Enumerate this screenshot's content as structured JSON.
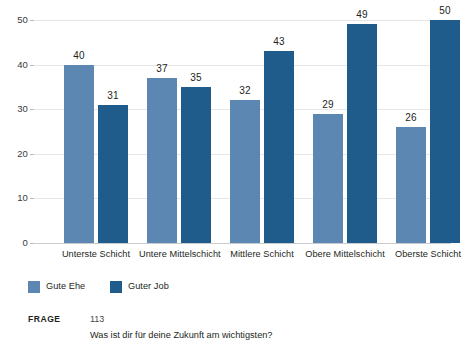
{
  "chart_data": {
    "type": "bar",
    "title": "",
    "subtitle": "",
    "xlabel": "",
    "ylabel": "",
    "ylim": [
      0,
      50
    ],
    "yticks": [
      0,
      10,
      20,
      30,
      40,
      50
    ],
    "ytick_labels": [
      "0",
      "10",
      "20",
      "30",
      "40",
      "50"
    ],
    "grid": true,
    "grid_axis": "y",
    "legend_position": "bottom-left",
    "categories": [
      "Unterste Schicht",
      "Untere Mittelschicht",
      "Mittlere Schicht",
      "Obere Mittelschicht",
      "Oberste Schicht"
    ],
    "series": [
      {
        "name": "Gute Ehe",
        "color": "#5b87b2",
        "values": [
          40,
          37,
          32,
          29,
          26
        ],
        "value_labels": [
          "40",
          "37",
          "32",
          "29",
          "26"
        ]
      },
      {
        "name": "Guter Job",
        "color": "#1f5c8b",
        "values": [
          31,
          35,
          43,
          49,
          50
        ],
        "value_labels": [
          "31",
          "35",
          "43",
          "49",
          "50"
        ]
      }
    ]
  },
  "legend": {
    "items": [
      {
        "label": "Gute Ehe",
        "swatch": "light"
      },
      {
        "label": "Guter Job",
        "swatch": "dark"
      }
    ]
  },
  "footer": {
    "key_label": "FRAGE",
    "number": "113",
    "question": "Was ist dir für deine Zukunft am wichtigsten?"
  },
  "colors": {
    "series_light": "#5b87b2",
    "series_dark": "#1f5c8b",
    "gridline": "#e4e6e7",
    "baseline": "#c9cbcd",
    "text": "#231f20"
  }
}
